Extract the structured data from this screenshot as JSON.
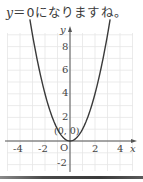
{
  "caption": {
    "var": "y",
    "eq": "＝0",
    "rest": "になりますね。"
  },
  "chart_data": {
    "type": "line",
    "function": "y = x^2",
    "x": [
      -5,
      -4,
      -3,
      -2,
      -1,
      0,
      1,
      2,
      3,
      4,
      5
    ],
    "series": [
      {
        "name": "y = x^2",
        "values": [
          25,
          16,
          9,
          4,
          1,
          0,
          1,
          4,
          9,
          16,
          25
        ]
      }
    ],
    "xlabel": "x",
    "ylabel": "y",
    "x_ticks": [
      "-4",
      "-2",
      "2",
      "4"
    ],
    "y_ticks": [
      "8",
      "6",
      "4",
      "2",
      "-2"
    ],
    "origin_label": "O",
    "annotation": "(0, 0)",
    "xlim": [
      -5,
      5
    ],
    "ylim": [
      -2.5,
      9.5
    ],
    "grid": true,
    "colors": {
      "curve": "#3a3a3a",
      "axis": "#555555",
      "grid": "#e6e6e6"
    }
  }
}
